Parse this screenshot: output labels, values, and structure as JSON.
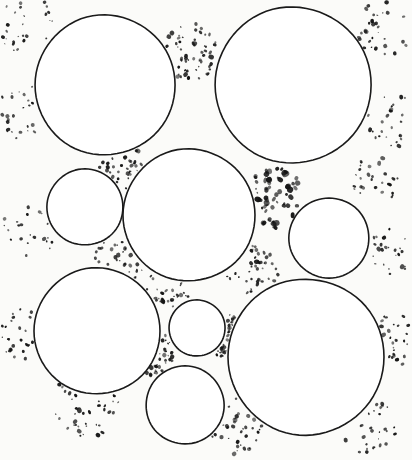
{
  "figure": {
    "title": "Circle packing with interstitial stipple matrix",
    "width": 412,
    "height": 460,
    "background_color": "#fbfbf9",
    "stroke_color": "#1a1a1a",
    "stipple_color": "#141414",
    "fill_color": "#ffffff",
    "stroke_width": 1.6
  },
  "chart_data": {
    "type": "scatter",
    "title": "Circle packing with interstitial stipple matrix",
    "xlabel": "",
    "ylabel": "",
    "xlim": [
      0,
      412
    ],
    "ylim": [
      0,
      460
    ],
    "grid": false,
    "legend": "none",
    "units": "pixels",
    "series": [
      {
        "name": "circles",
        "shape": "circle",
        "points": [
          {
            "id": "grain-top-left",
            "label": "A",
            "cx": 105,
            "cy": 85,
            "r": 70
          },
          {
            "id": "grain-top-right",
            "label": "B",
            "cx": 293,
            "cy": 85,
            "r": 78
          },
          {
            "id": "grain-left-small",
            "label": "C",
            "cx": 85,
            "cy": 207,
            "r": 38
          },
          {
            "id": "grain-center",
            "label": "D",
            "cx": 189,
            "cy": 215,
            "r": 66
          },
          {
            "id": "grain-right-mid",
            "label": "E",
            "cx": 329,
            "cy": 238,
            "r": 40
          },
          {
            "id": "grain-bottom-left",
            "label": "F",
            "cx": 97,
            "cy": 331,
            "r": 63
          },
          {
            "id": "grain-center-tiny",
            "label": "G",
            "cx": 197,
            "cy": 328,
            "r": 28
          },
          {
            "id": "grain-bottom-mid",
            "label": "H",
            "cx": 185,
            "cy": 405,
            "r": 39
          },
          {
            "id": "grain-bottom-right",
            "label": "I",
            "cx": 306,
            "cy": 357,
            "r": 78
          }
        ]
      },
      {
        "name": "stipple-pore-regions",
        "shape": "point-cloud",
        "note": "Dot density per interstitial pore region; dots are scattered within each listed radius of the region centre.",
        "points": [
          {
            "id": "pore-top-left-corner",
            "cx": 30,
            "cy": 30,
            "r": 34,
            "density": 26,
            "dot_size": 1.5
          },
          {
            "id": "pore-top-center",
            "cx": 192,
            "cy": 52,
            "r": 32,
            "density": 58,
            "dot_size": 1.6
          },
          {
            "id": "pore-top-right-corner",
            "cx": 385,
            "cy": 30,
            "r": 32,
            "density": 30,
            "dot_size": 1.5
          },
          {
            "id": "pore-left-upper",
            "cx": 26,
            "cy": 110,
            "r": 30,
            "density": 24,
            "dot_size": 1.4
          },
          {
            "id": "pore-right-upper",
            "cx": 392,
            "cy": 120,
            "r": 28,
            "density": 26,
            "dot_size": 1.5
          },
          {
            "id": "pore-a-c-d",
            "cx": 120,
            "cy": 166,
            "r": 24,
            "density": 34,
            "dot_size": 1.5
          },
          {
            "id": "pore-b-d-e",
            "cx": 274,
            "cy": 198,
            "r": 30,
            "density": 62,
            "dot_size": 2.0
          },
          {
            "id": "pore-left-mid",
            "cx": 28,
            "cy": 230,
            "r": 30,
            "density": 22,
            "dot_size": 1.4
          },
          {
            "id": "pore-c-d-f",
            "cx": 118,
            "cy": 262,
            "r": 26,
            "density": 30,
            "dot_size": 1.5
          },
          {
            "id": "pore-d-g-f",
            "cx": 168,
            "cy": 288,
            "r": 22,
            "density": 30,
            "dot_size": 1.5
          },
          {
            "id": "pore-d-e-i",
            "cx": 252,
            "cy": 272,
            "r": 26,
            "density": 40,
            "dot_size": 1.6
          },
          {
            "id": "pore-right-mid",
            "cx": 390,
            "cy": 250,
            "r": 26,
            "density": 24,
            "dot_size": 1.5
          },
          {
            "id": "pore-left-lower",
            "cx": 24,
            "cy": 330,
            "r": 30,
            "density": 26,
            "dot_size": 1.5
          },
          {
            "id": "pore-g-h-f",
            "cx": 150,
            "cy": 352,
            "r": 24,
            "density": 34,
            "dot_size": 1.5
          },
          {
            "id": "pore-g-h-i",
            "cx": 226,
            "cy": 336,
            "r": 22,
            "density": 30,
            "dot_size": 1.5
          },
          {
            "id": "pore-bottom-left",
            "cx": 86,
            "cy": 404,
            "r": 34,
            "density": 40,
            "dot_size": 1.6
          },
          {
            "id": "pore-bottom-center",
            "cx": 234,
            "cy": 424,
            "r": 30,
            "density": 34,
            "dot_size": 1.5
          },
          {
            "id": "pore-bottom-right",
            "cx": 368,
            "cy": 424,
            "r": 30,
            "density": 28,
            "dot_size": 1.5
          },
          {
            "id": "pore-right-lower",
            "cx": 394,
            "cy": 340,
            "r": 26,
            "density": 26,
            "dot_size": 1.5
          },
          {
            "id": "pore-b-e-right",
            "cx": 376,
            "cy": 180,
            "r": 24,
            "density": 30,
            "dot_size": 1.6
          }
        ]
      }
    ]
  }
}
